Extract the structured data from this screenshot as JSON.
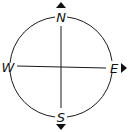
{
  "diagram": {
    "directions": {
      "north": "N",
      "south": "S",
      "east": "E",
      "west": "W"
    },
    "colors": {
      "stroke": "#1a1a1a",
      "background": "#ffffff"
    }
  }
}
